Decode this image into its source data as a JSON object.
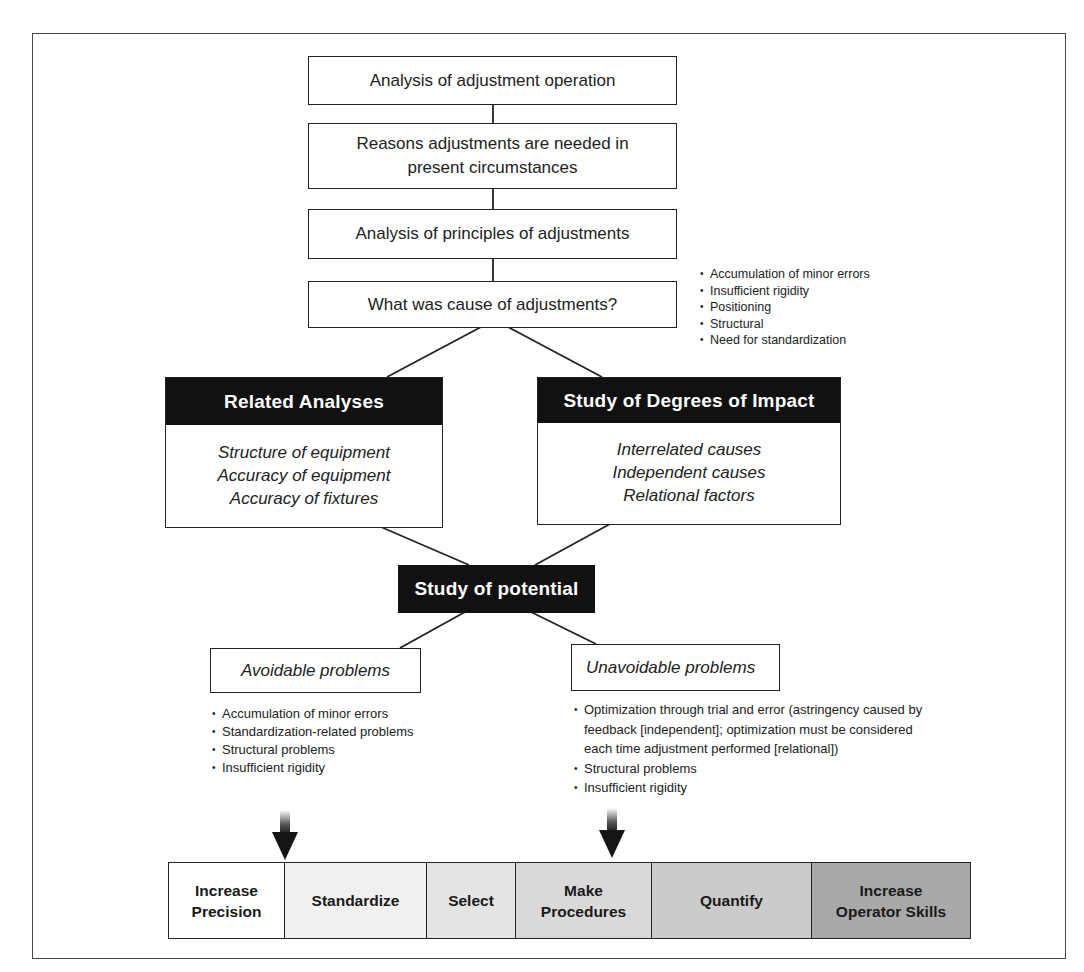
{
  "diagram": {
    "flow_boxes": [
      {
        "label": "Analysis of adjustment operation"
      },
      {
        "label": "Reasons adjustments are needed in present circumstances"
      },
      {
        "label": "Analysis of principles of adjustments"
      },
      {
        "label": "What was cause of adjustments?"
      }
    ],
    "cause_notes": [
      "Accumulation of minor errors",
      "Insufficient rigidity",
      "Positioning",
      "Structural",
      "Need for standardization"
    ],
    "related_analyses": {
      "title": "Related Analyses",
      "items": [
        "Structure of equipment",
        "Accuracy of equipment",
        "Accuracy of fixtures"
      ]
    },
    "degrees_of_impact": {
      "title": "Study of Degrees of Impact",
      "items": [
        "Interrelated causes",
        "Independent causes",
        "Relational factors"
      ]
    },
    "study_of_potential": {
      "title": "Study of potential"
    },
    "avoidable": {
      "title": "Avoidable problems",
      "items": [
        "Accumulation of minor errors",
        "Standardization-related problems",
        "Structural problems",
        "Insufficient rigidity"
      ]
    },
    "unavoidable": {
      "title": "Unavoidable problems",
      "items": [
        "Optimization through trial and error (astringency caused by feedback [independent]; optimization must be considered each time adjustment performed [relational])",
        "Structural problems",
        "Insufficient rigidity"
      ]
    },
    "actions": [
      {
        "line1": "Increase",
        "line2": "Precision",
        "shade": "#ffffff"
      },
      {
        "line1": "Standardize",
        "line2": "",
        "shade": "#f1f1f1"
      },
      {
        "line1": "Select",
        "line2": "",
        "shade": "#e4e4e4"
      },
      {
        "line1": "Make",
        "line2": "Procedures",
        "shade": "#d9d9d9"
      },
      {
        "line1": "Quantify",
        "line2": "",
        "shade": "#cbcbcb"
      },
      {
        "line1": "Increase",
        "line2": "Operator Skills",
        "shade": "#a9a9a9"
      }
    ],
    "arrows": [
      {
        "name": "avoidable-arrow",
        "target": "Increase Precision"
      },
      {
        "name": "unavoidable-arrow",
        "target": "Make Procedures"
      }
    ]
  }
}
